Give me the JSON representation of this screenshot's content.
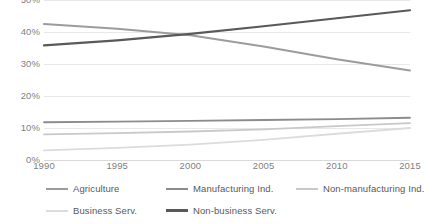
{
  "chart_data": {
    "type": "line",
    "title": "",
    "subtitle": "",
    "xlabel": "",
    "ylabel": "",
    "x": [
      1990,
      1995,
      2000,
      2005,
      2010,
      2015
    ],
    "xlim": [
      1990,
      2015
    ],
    "ylim": [
      0,
      50
    ],
    "grid": true,
    "legend_position": "bottom",
    "x_tick_labels": [
      "1990",
      "1995",
      "2000",
      "2005",
      "2010",
      "2015"
    ],
    "y_tick_labels": [
      "0%",
      "10%",
      "20%",
      "30%",
      "40%",
      "50%"
    ],
    "y_tick_values": [
      0,
      10,
      20,
      30,
      40,
      50
    ],
    "series": [
      {
        "name": "Agriculture",
        "color": "#9c9c9c",
        "width": 2.0,
        "values": [
          42.5,
          41.0,
          39.0,
          35.5,
          31.5,
          28.0
        ]
      },
      {
        "name": "Manufacturing Ind.",
        "color": "#8c8c8c",
        "width": 1.8,
        "values": [
          11.8,
          12.0,
          12.2,
          12.5,
          12.8,
          13.2
        ]
      },
      {
        "name": "Non-manufacturing Ind.",
        "color": "#c9c9c9",
        "width": 1.8,
        "values": [
          8.0,
          8.4,
          8.9,
          9.6,
          10.6,
          11.5
        ]
      },
      {
        "name": "Business Serv.",
        "color": "#dcdcdc",
        "width": 1.8,
        "values": [
          3.0,
          3.8,
          4.8,
          6.3,
          8.2,
          10.0
        ]
      },
      {
        "name": "Non-business Serv.",
        "color": "#595959",
        "width": 2.2,
        "values": [
          35.8,
          37.4,
          39.4,
          41.8,
          44.3,
          46.8
        ]
      }
    ]
  },
  "legend": {
    "items": [
      {
        "label": "Agriculture",
        "color": "#9c9c9c",
        "thickness": "2px",
        "left": 46,
        "top": 3
      },
      {
        "label": "Manufacturing Ind.",
        "color": "#8c8c8c",
        "thickness": "2px",
        "left": 166,
        "top": 3
      },
      {
        "label": "Non-manufacturing Ind.",
        "color": "#c9c9c9",
        "thickness": "2px",
        "left": 296,
        "top": 3
      },
      {
        "label": "Business Serv.",
        "color": "#dcdcdc",
        "thickness": "2px",
        "left": 46,
        "top": 25
      },
      {
        "label": "Non-business Serv.",
        "color": "#595959",
        "thickness": "3px",
        "left": 166,
        "top": 25
      }
    ]
  }
}
